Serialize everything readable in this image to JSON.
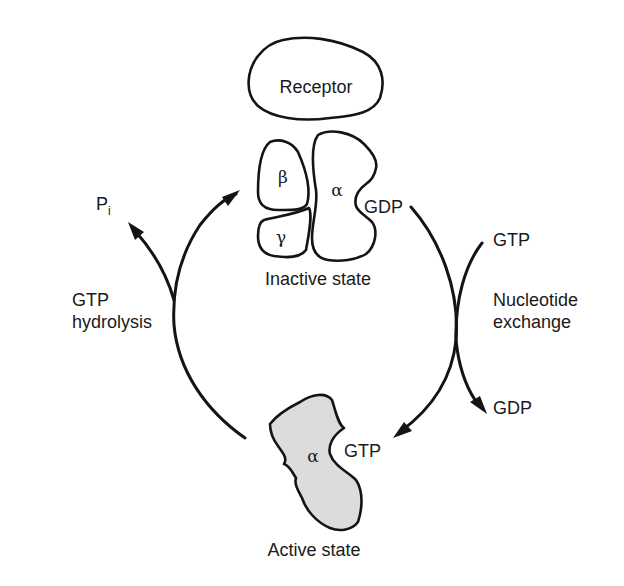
{
  "diagram": {
    "type": "cycle",
    "nodes": {
      "receptor": {
        "label": "Receptor"
      },
      "inactive": {
        "caption": "Inactive state",
        "subunits": {
          "beta": "β",
          "gamma": "γ",
          "alpha": "α"
        },
        "bound_nucleotide": "GDP"
      },
      "active": {
        "caption": "Active state",
        "subunit": "α",
        "bound_nucleotide": "GTP"
      }
    },
    "edges": {
      "nucleotide_exchange": {
        "label_line1": "Nucleotide",
        "label_line2": "exchange",
        "input": "GTP",
        "output": "GDP"
      },
      "gtp_hydrolysis": {
        "label_line1": "GTP",
        "label_line2": "hydrolysis",
        "output": "P",
        "output_subscript": "i"
      }
    },
    "colors": {
      "stroke": "#141414",
      "active_fill": "#dcdcdc",
      "background": "#ffffff"
    }
  }
}
